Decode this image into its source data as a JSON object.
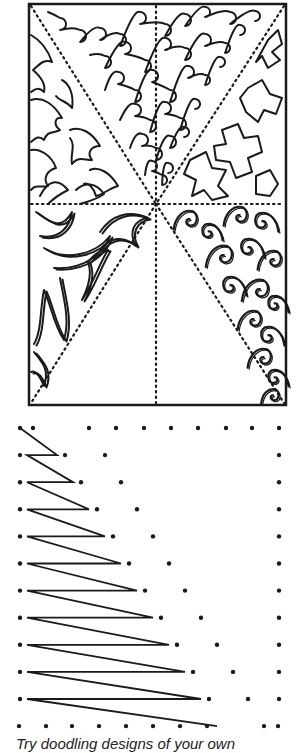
{
  "page": {
    "caption": "Try doodling designs of your own"
  },
  "colors": {
    "ink": "#1a1a1a",
    "paper": "#ffffff"
  },
  "illustration": {
    "panel": {
      "name": "doodle-pattern-panel",
      "sections": [
        {
          "id": "top-left",
          "pattern": "leaves"
        },
        {
          "id": "top-center",
          "pattern": "loops"
        },
        {
          "id": "top-right",
          "pattern": "zigzag-shapes"
        },
        {
          "id": "bottom-left",
          "pattern": "flames"
        },
        {
          "id": "bottom-center",
          "pattern": "empty"
        },
        {
          "id": "bottom-right",
          "pattern": "swirls"
        }
      ]
    },
    "dot_grid": {
      "name": "string-art-dot-grid",
      "rows": 12,
      "zigzag_lines": 11
    }
  }
}
